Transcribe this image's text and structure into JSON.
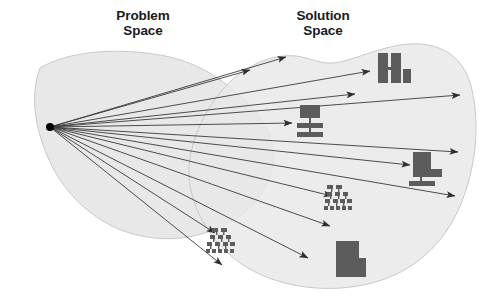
{
  "figure": {
    "type": "concept-diagram",
    "title_problem": "Problem\nSpace",
    "title_solution": "Solution\nSpace",
    "background_color": "#ffffff",
    "blob_fill": "#e8e8e8",
    "blob_stroke": "#c8c8c8",
    "arrow_color": "#3a3a3a",
    "icon_color": "#595959",
    "source_point_color": "#000000"
  },
  "labels": {
    "problem": {
      "text": "Problem\nSpace",
      "x": 143,
      "y": 22
    },
    "solution": {
      "text": "Solution\nSpace",
      "x": 323,
      "y": 22
    }
  },
  "source_point": {
    "x": 50,
    "y": 127,
    "r": 4
  },
  "arrows": [
    {
      "name": "arrow-1",
      "x2": 250,
      "y2": 70
    },
    {
      "name": "arrow-2",
      "x2": 286,
      "y2": 57
    },
    {
      "name": "arrow-3",
      "x2": 370,
      "y2": 71
    },
    {
      "name": "arrow-4",
      "x2": 355,
      "y2": 94
    },
    {
      "name": "arrow-5",
      "x2": 460,
      "y2": 95
    },
    {
      "name": "arrow-6",
      "x2": 292,
      "y2": 123
    },
    {
      "name": "arrow-7",
      "x2": 458,
      "y2": 152
    },
    {
      "name": "arrow-8",
      "x2": 410,
      "y2": 165
    },
    {
      "name": "arrow-9",
      "x2": 455,
      "y2": 196
    },
    {
      "name": "arrow-10",
      "x2": 332,
      "y2": 196
    },
    {
      "name": "arrow-11",
      "x2": 330,
      "y2": 226
    },
    {
      "name": "arrow-12",
      "x2": 215,
      "y2": 233
    },
    {
      "name": "arrow-13",
      "x2": 308,
      "y2": 258
    },
    {
      "name": "arrow-14",
      "x2": 222,
      "y2": 265
    }
  ],
  "icons": [
    {
      "name": "bar-chart-icon",
      "label": "bar chart",
      "x": 378,
      "y": 52
    },
    {
      "name": "flow-diagram-icon",
      "label": "flow diagram",
      "x": 297,
      "y": 104
    },
    {
      "name": "block-stack-icon",
      "label": "block with base",
      "x": 412,
      "y": 150
    },
    {
      "name": "tree-chart-icon",
      "label": "hierarchy tree",
      "x": 325,
      "y": 184
    },
    {
      "name": "tree-chart-icon-2",
      "label": "hierarchy tree",
      "x": 200,
      "y": 228
    },
    {
      "name": "notched-block-icon",
      "label": "notched block",
      "x": 336,
      "y": 240
    }
  ],
  "blobs": {
    "problem": {
      "name": "problem-space-blob"
    },
    "solution": {
      "name": "solution-space-blob"
    }
  }
}
